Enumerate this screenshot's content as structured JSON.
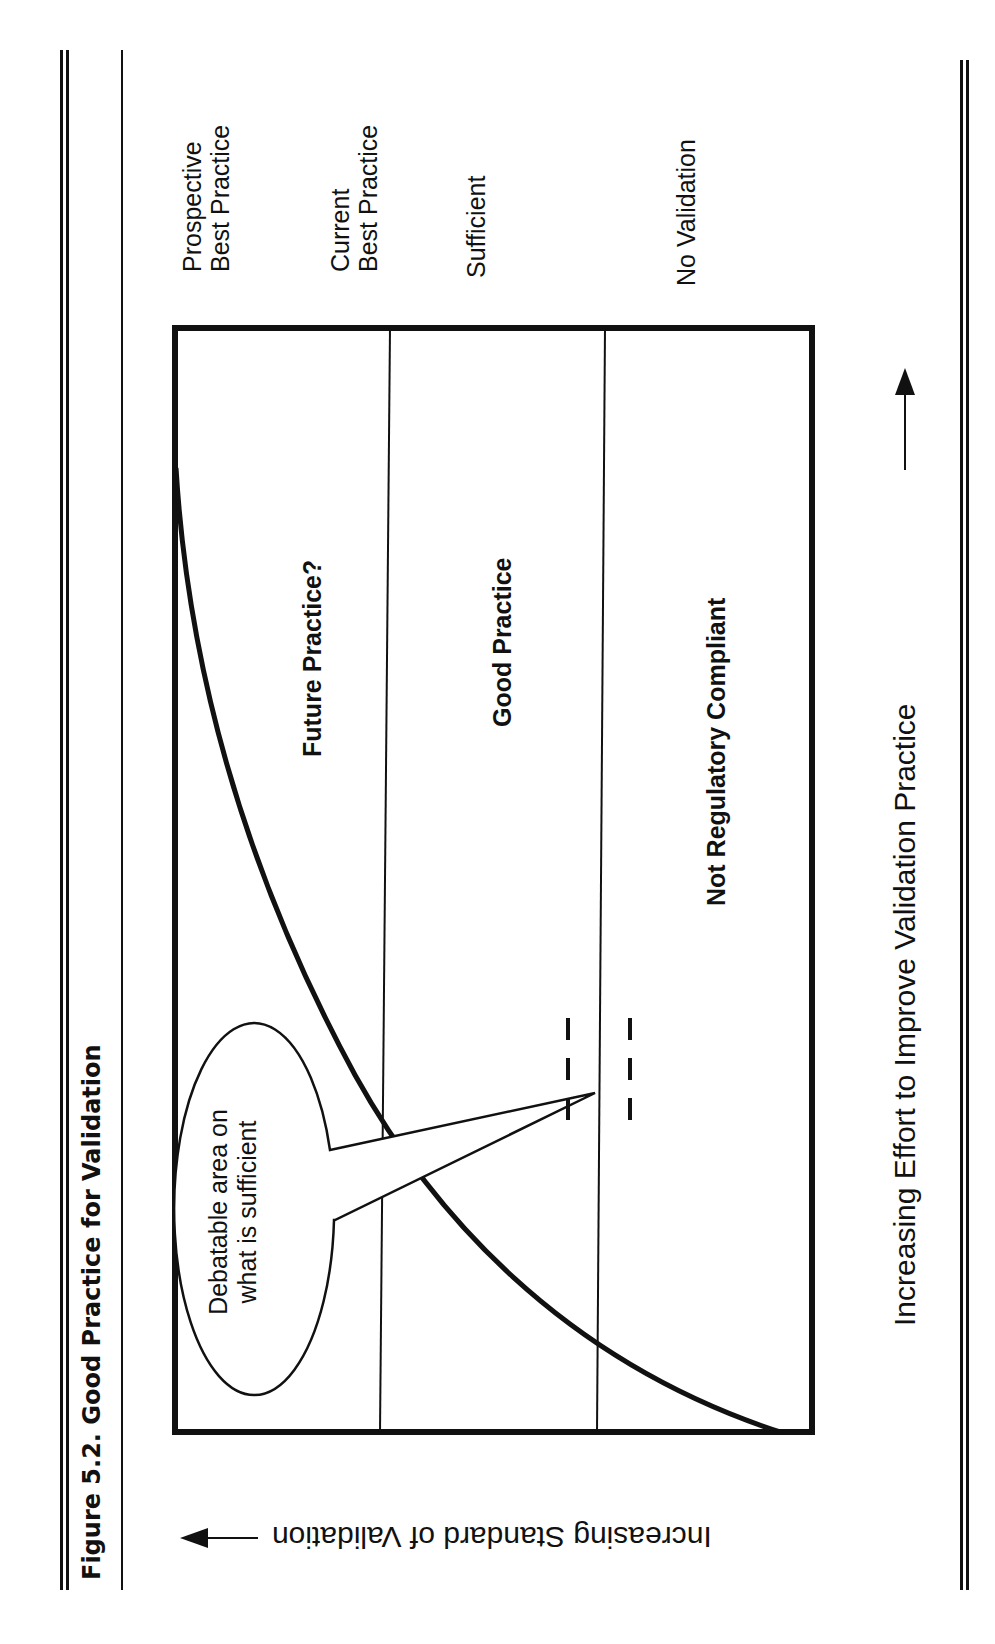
{
  "figure": {
    "caption": "Figure 5.2. Good Practice for Validation",
    "orientation": "rotated 90° counter-clockwise (landscape figure on portrait page)"
  },
  "levels": [
    {
      "id": "prospective",
      "line1": "Prospective",
      "line2": "Best Practice"
    },
    {
      "id": "current",
      "line1": "Current",
      "line2": "Best Practice"
    },
    {
      "id": "sufficient",
      "line1": "Sufficient",
      "line2": ""
    },
    {
      "id": "none",
      "line1": "No Validation",
      "line2": ""
    }
  ],
  "regions": {
    "future": "Future Practice?",
    "good": "Good Practice",
    "noncompliant": "Not Regulatory Compliant"
  },
  "callout": {
    "line1": "Debatable area on",
    "line2": "what is sufficient"
  },
  "axes": {
    "x_label": "Increasing Effort to Improve Validation Practice",
    "y_label": "Increasing Standard of Validation"
  },
  "colors": {
    "ink": "#111111",
    "paper": "#ffffff"
  }
}
